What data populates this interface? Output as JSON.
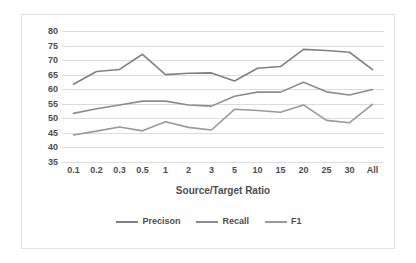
{
  "chart_data": {
    "type": "line",
    "title": "",
    "xlabel": "Source/Target Ratio",
    "ylabel": "",
    "categories": [
      "0.1",
      "0.2",
      "0.3",
      "0.5",
      "1",
      "2",
      "3",
      "5",
      "10",
      "15",
      "20",
      "25",
      "30",
      "All"
    ],
    "ylim": [
      35,
      80
    ],
    "ytick_step": 5,
    "yticks": [
      "80",
      "75",
      "70",
      "65",
      "60",
      "55",
      "50",
      "45",
      "40",
      "35"
    ],
    "grid": true,
    "legend_position": "bottom",
    "series": [
      {
        "name": "Precison",
        "color": "#808080",
        "values": [
          61.7,
          66.1,
          66.8,
          72.0,
          65.0,
          65.5,
          65.6,
          62.8,
          67.2,
          67.8,
          73.7,
          73.3,
          72.7,
          66.7
        ]
      },
      {
        "name": "Recall",
        "color": "#8c8c8c",
        "values": [
          51.7,
          53.3,
          54.6,
          55.9,
          55.9,
          54.6,
          54.2,
          57.6,
          59.0,
          59.0,
          62.4,
          59.1,
          58.0,
          59.9
        ]
      },
      {
        "name": "F1",
        "color": "#999999",
        "values": [
          44.3,
          45.6,
          47.0,
          45.7,
          48.8,
          46.9,
          46.0,
          53.1,
          52.7,
          52.1,
          54.6,
          49.3,
          48.5,
          54.8
        ]
      }
    ]
  },
  "legend": {
    "items": [
      {
        "label": "Precison"
      },
      {
        "label": "Recall"
      },
      {
        "label": "F1"
      }
    ]
  },
  "axes": {
    "x_title": "Source/Target Ratio"
  },
  "colors": {
    "gridline": "#dcdcdc",
    "text": "#4d4d4d",
    "border": "#e3e3e3",
    "background": "#ffffff"
  }
}
